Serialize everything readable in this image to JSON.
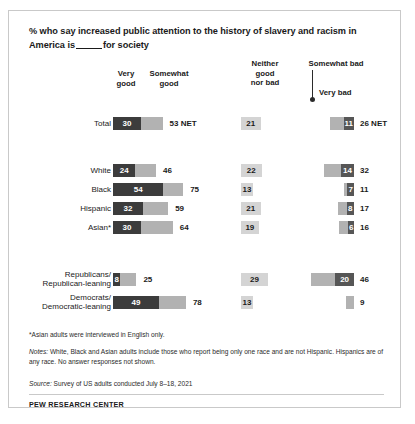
{
  "title": {
    "part1": "% who say increased public attention to the history of slavery and racism in America is",
    "part2": "for society"
  },
  "headers": {
    "very_good": "Very\ngood",
    "somewhat_good": "Somewhat\ngood",
    "neither": "Neither\ngood\nnor bad",
    "somewhat_bad": "Somewhat bad",
    "very_bad": "Very bad"
  },
  "notes": {
    "asterisk": "*Asian adults were interviewed in English only.",
    "notes_label": "Notes:",
    "notes_text": " White, Black and Asian adults include those who report being only one race and are not Hispanic. Hispanics are of any race. No answer responses not shown.",
    "source_label": "Source:",
    "source_text": " Survey of US adults conducted July 8–18, 2021",
    "footer": "PEW RESEARCH CENTER"
  },
  "colors": {
    "very_good": "#3c3c3c",
    "somewhat_good": "#b2b2b2",
    "neither": "#d4d4d4",
    "somewhat_bad": "#b2b2b2",
    "very_bad": "#565656"
  },
  "chart_data": {
    "type": "bar",
    "xlabel": "",
    "ylabel": "",
    "orientation": "horizontal",
    "stacked": true,
    "categories": [
      "Total",
      "White",
      "Black",
      "Hispanic",
      "Asian*",
      "Republicans/Republican-leaning",
      "Democrats/Democratic-leaning"
    ],
    "series": [
      {
        "name": "Very good",
        "values": [
          30,
          24,
          54,
          32,
          30,
          8,
          49
        ]
      },
      {
        "name": "Somewhat good",
        "values": [
          23,
          22,
          21,
          27,
          34,
          17,
          29
        ]
      },
      {
        "name": "Neither good nor bad",
        "values": [
          21,
          22,
          13,
          21,
          19,
          29,
          13
        ]
      },
      {
        "name": "Somewhat bad",
        "values": [
          15,
          18,
          4,
          9,
          10,
          26,
          9
        ]
      },
      {
        "name": "Very bad",
        "values": [
          11,
          14,
          7,
          8,
          6,
          20,
          0
        ]
      }
    ],
    "nets": {
      "good": [
        53,
        46,
        75,
        59,
        64,
        25,
        78
      ],
      "bad": [
        26,
        32,
        11,
        17,
        16,
        46,
        9
      ]
    },
    "legend_position": "top",
    "grid": false
  },
  "rows": [
    {
      "label": "Total",
      "label_lines": [
        "Total"
      ],
      "top": 106,
      "very_good": 30,
      "good_net": 53,
      "good_net_text": "53 NET",
      "neither": 21,
      "very_bad": 11,
      "bad_net": 26,
      "bad_net_text": "26 NET",
      "very_bad_text": "11"
    },
    {
      "label": "White",
      "label_lines": [
        "White"
      ],
      "top": 153,
      "very_good": 24,
      "good_net": 46,
      "good_net_text": "46",
      "neither": 22,
      "very_bad": 14,
      "bad_net": 32,
      "bad_net_text": "32",
      "very_bad_text": "14"
    },
    {
      "label": "Black",
      "label_lines": [
        "Black"
      ],
      "top": 172,
      "very_good": 54,
      "good_net": 75,
      "good_net_text": "75",
      "neither": 13,
      "very_bad": 7,
      "bad_net": 11,
      "bad_net_text": "11",
      "very_bad_text": "7"
    },
    {
      "label": "Hispanic",
      "label_lines": [
        "Hispanic"
      ],
      "top": 191,
      "very_good": 32,
      "good_net": 59,
      "good_net_text": "59",
      "neither": 21,
      "very_bad": 8,
      "bad_net": 17,
      "bad_net_text": "17",
      "very_bad_text": "8"
    },
    {
      "label": "Asian*",
      "label_lines": [
        "Asian*"
      ],
      "top": 210,
      "very_good": 30,
      "good_net": 64,
      "good_net_text": "64",
      "neither": 19,
      "very_bad": 6,
      "bad_net": 16,
      "bad_net_text": "16",
      "very_bad_text": "6"
    },
    {
      "label": "Republicans/Republican-leaning",
      "label_lines": [
        "Republicans/",
        "Republican-leaning"
      ],
      "top": 262,
      "very_good": 8,
      "good_net": 25,
      "good_net_text": "25",
      "neither": 29,
      "very_bad": 20,
      "bad_net": 46,
      "bad_net_text": "46",
      "very_bad_text": "20"
    },
    {
      "label": "Democrats/Democratic-leaning",
      "label_lines": [
        "Democrats/",
        "Democratic-leaning"
      ],
      "top": 285,
      "very_good": 49,
      "good_net": 78,
      "good_net_text": "78",
      "neither": 13,
      "very_bad": 0,
      "bad_net": 9,
      "bad_net_text": "9",
      "very_bad_text": ""
    }
  ]
}
